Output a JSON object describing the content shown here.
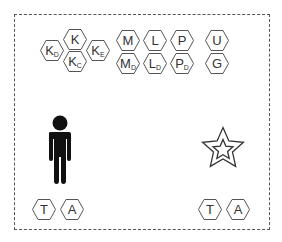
{
  "diagram": {
    "frame": {
      "style": "dashed",
      "color": "#555555"
    },
    "hexagons": [
      {
        "id": "k",
        "main": "K",
        "sub": "",
        "x": 63,
        "y": 29
      },
      {
        "id": "kd",
        "main": "K",
        "sub": "D",
        "x": 40,
        "y": 40
      },
      {
        "id": "ke",
        "main": "K",
        "sub": "E",
        "x": 86,
        "y": 40
      },
      {
        "id": "kc",
        "main": "K",
        "sub": "C",
        "x": 63,
        "y": 51
      },
      {
        "id": "m",
        "main": "M",
        "sub": "",
        "x": 116,
        "y": 30
      },
      {
        "id": "md",
        "main": "M",
        "sub": "D",
        "x": 116,
        "y": 53
      },
      {
        "id": "l",
        "main": "L",
        "sub": "",
        "x": 143,
        "y": 30
      },
      {
        "id": "ld",
        "main": "L",
        "sub": "D",
        "x": 143,
        "y": 53
      },
      {
        "id": "p",
        "main": "P",
        "sub": "",
        "x": 170,
        "y": 30
      },
      {
        "id": "pd",
        "main": "P",
        "sub": "D",
        "x": 170,
        "y": 53
      },
      {
        "id": "u",
        "main": "U",
        "sub": "",
        "x": 205,
        "y": 30
      },
      {
        "id": "g",
        "main": "G",
        "sub": "",
        "x": 205,
        "y": 53
      },
      {
        "id": "t1",
        "main": "T",
        "sub": "",
        "x": 32,
        "y": 199
      },
      {
        "id": "a1",
        "main": "A",
        "sub": "",
        "x": 60,
        "y": 199
      },
      {
        "id": "t2",
        "main": "T",
        "sub": "",
        "x": 198,
        "y": 199
      },
      {
        "id": "a2",
        "main": "A",
        "sub": "",
        "x": 226,
        "y": 199
      }
    ],
    "figure": {
      "icon": "person-icon",
      "color": "#111111"
    },
    "star": {
      "icon": "double-star-icon",
      "color": "#333333"
    }
  }
}
